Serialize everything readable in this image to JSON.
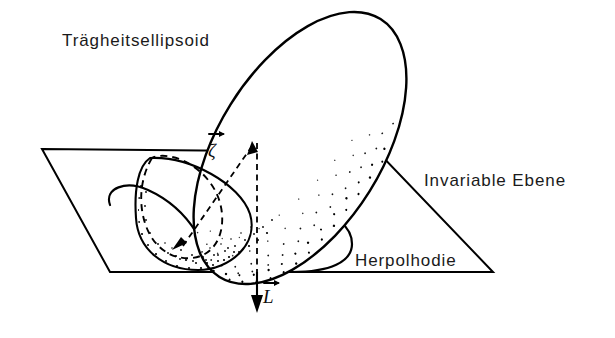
{
  "figure": {
    "background_color": "#ffffff",
    "ink_color": "#000000",
    "labels": {
      "ellipsoid": "Trägheitsellipsoid",
      "plane": "Invariable Ebene",
      "herpolhode": "Herpolhodie",
      "angular_velocity_vector": "ζ",
      "angular_momentum_vector": "L"
    },
    "annotations": {
      "ellipsoid_name": "inertia-ellipsoid",
      "plane_name": "invariable-plane",
      "herpolhode_name": "herpolhode-curve",
      "polhode_name": "polhode-curve-dashed",
      "contact_point_name": "contact-point"
    },
    "vectors": [
      {
        "symbol": "ζ",
        "name": "angular-velocity-vector",
        "style": "dashed",
        "direction": "from-contact-point-up-right",
        "has_overbar_arrow": true
      },
      {
        "symbol": "L",
        "name": "angular-momentum-vector",
        "style": "solid",
        "direction": "downward-normal-to-plane",
        "has_overbar_arrow": true
      }
    ],
    "geometry": {
      "plane_corners": [
        [
          42,
          149
        ],
        [
          378,
          152
        ],
        [
          493,
          272
        ],
        [
          110,
          272
        ]
      ],
      "ellipsoid_center": [
        300,
        148
      ],
      "ellipsoid_rx": 82,
      "ellipsoid_ry": 152,
      "ellipsoid_rotation_deg": 32,
      "contact_point": [
        196,
        258
      ],
      "vertical_axis_x": 257,
      "l_arrow_tip_y": 312
    }
  }
}
